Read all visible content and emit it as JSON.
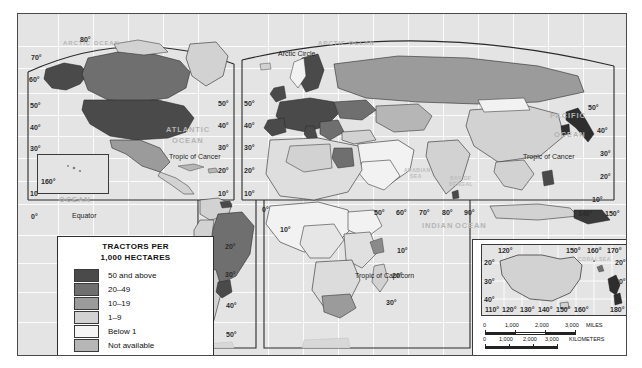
{
  "map": {
    "title": "World Tractors per 1,000 Hectares",
    "projection_note": "MODIFIED GOODE'S HOMOLOSINE EQUAL-AREA PROJECTION"
  },
  "legend": {
    "title_line1": "TRACTORS PER",
    "title_line2": "1,000 HECTARES",
    "items": [
      {
        "label": "50 and above",
        "color": "#4a4a4a"
      },
      {
        "label": "20–49",
        "color": "#6f6f6f"
      },
      {
        "label": "10–19",
        "color": "#9b9b9b"
      },
      {
        "label": "1–9",
        "color": "#d2d2d2"
      },
      {
        "label": "Below 1",
        "color": "#f2f2f2"
      },
      {
        "label": "Not available",
        "color": "#b6b6b6"
      }
    ]
  },
  "ocean_labels": [
    {
      "text": "ARCTIC OCEAN",
      "x": 60,
      "y": 30
    },
    {
      "text": "ARCTIC OCEAN",
      "x": 320,
      "y": 30
    },
    {
      "text": "ATLANTIC",
      "x": 166,
      "y": 115
    },
    {
      "text": "OCEAN",
      "x": 172,
      "y": 126
    },
    {
      "text": "PACIFIC",
      "x": 57,
      "y": 162
    },
    {
      "text": "OCEAN",
      "x": 60,
      "y": 186
    },
    {
      "text": "PACIFIC",
      "x": 551,
      "y": 102
    },
    {
      "text": "OCEAN",
      "x": 555,
      "y": 121
    },
    {
      "text": "INDIAN",
      "x": 422,
      "y": 212
    },
    {
      "text": "OCEAN",
      "x": 455,
      "y": 212
    }
  ],
  "sea_labels": [
    {
      "text": "ARABIAN",
      "x": 404,
      "y": 158
    },
    {
      "text": "SEA",
      "x": 409,
      "y": 164
    },
    {
      "text": "BAY OF",
      "x": 450,
      "y": 166
    },
    {
      "text": "BENGAL",
      "x": 449,
      "y": 172
    },
    {
      "text": "CORAL",
      "x": 559,
      "y": 242
    },
    {
      "text": "SEA",
      "x": 580,
      "y": 242
    }
  ],
  "line_labels": [
    {
      "text": "Arctic Circle",
      "x": 278,
      "y": 40
    },
    {
      "text": "Tropic of Cancer",
      "x": 169,
      "y": 143
    },
    {
      "text": "Tropic of Cancer",
      "x": 540,
      "y": 143
    },
    {
      "text": "Equator",
      "x": 72,
      "y": 202
    },
    {
      "text": "Tropic of Capricorn",
      "x": 372,
      "y": 262
    }
  ],
  "latitude_labels_west": [
    {
      "text": "70°",
      "x": 23,
      "y": 44
    },
    {
      "text": "60°",
      "x": 22,
      "y": 66
    },
    {
      "text": "50°",
      "x": 23,
      "y": 92
    },
    {
      "text": "40°",
      "x": 23,
      "y": 114
    },
    {
      "text": "30°",
      "x": 23,
      "y": 135
    },
    {
      "text": "20°",
      "x": 23,
      "y": 155
    },
    {
      "text": "10°",
      "x": 23,
      "y": 180
    },
    {
      "text": "0°",
      "x": 24,
      "y": 203
    }
  ],
  "latitude_labels_80": {
    "text": "80°",
    "x": 73,
    "y": 26
  },
  "latitude_labels_atlantic": [
    {
      "text": "50°",
      "x": 218,
      "y": 90
    },
    {
      "text": "40°",
      "x": 218,
      "y": 112
    },
    {
      "text": "30°",
      "x": 218,
      "y": 134
    },
    {
      "text": "20°",
      "x": 218,
      "y": 157
    },
    {
      "text": "10°",
      "x": 218,
      "y": 180
    }
  ],
  "latitude_labels_eur": [
    {
      "text": "50°",
      "x": 240,
      "y": 90
    },
    {
      "text": "40°",
      "x": 240,
      "y": 112
    },
    {
      "text": "30°",
      "x": 240,
      "y": 134
    },
    {
      "text": "20°",
      "x": 240,
      "y": 157
    },
    {
      "text": "10°",
      "x": 240,
      "y": 180
    }
  ],
  "latitude_labels_samerica": [
    {
      "text": "10°",
      "x": 200,
      "y": 182
    },
    {
      "text": "20°",
      "x": 225,
      "y": 233
    },
    {
      "text": "30°",
      "x": 225,
      "y": 261
    },
    {
      "text": "40°",
      "x": 226,
      "y": 292
    },
    {
      "text": "50°",
      "x": 226,
      "y": 321
    }
  ],
  "latitude_labels_africa": [
    {
      "text": "10°",
      "x": 330,
      "y": 236
    },
    {
      "text": "20°",
      "x": 325,
      "y": 261
    },
    {
      "text": "30°",
      "x": 317,
      "y": 290
    },
    {
      "text": "10°",
      "x": 397,
      "y": 237
    },
    {
      "text": "20°",
      "x": 392,
      "y": 262
    },
    {
      "text": "30°",
      "x": 386,
      "y": 289
    }
  ],
  "latitude_labels_east": [
    {
      "text": "50°",
      "x": 588,
      "y": 94
    },
    {
      "text": "40°",
      "x": 597,
      "y": 117
    },
    {
      "text": "30°",
      "x": 600,
      "y": 140
    },
    {
      "text": "20°",
      "x": 600,
      "y": 163
    },
    {
      "text": "10°",
      "x": 592,
      "y": 186
    }
  ],
  "longitude_labels_main": [
    {
      "text": "160°",
      "x": 22,
      "y": 166
    },
    {
      "text": "0°",
      "x": 262,
      "y": 196
    },
    {
      "text": "10°",
      "x": 280,
      "y": 216
    },
    {
      "text": "50°",
      "x": 374,
      "y": 199
    },
    {
      "text": "60°",
      "x": 396,
      "y": 199
    },
    {
      "text": "70°",
      "x": 419,
      "y": 199
    },
    {
      "text": "80°",
      "x": 442,
      "y": 199
    },
    {
      "text": "90°",
      "x": 464,
      "y": 199
    },
    {
      "text": "140°",
      "x": 578,
      "y": 200
    },
    {
      "text": "150°",
      "x": 605,
      "y": 200
    }
  ],
  "australia_inset": {
    "lon_top": [
      "120°",
      "150°",
      "160°",
      "170°"
    ],
    "lon_bottom": [
      "110°",
      "120°",
      "130°",
      "140°",
      "150°",
      "160°",
      "180°"
    ],
    "lat_left": [
      "20°",
      "30°",
      "40°"
    ],
    "lat_right": [
      "20°",
      "30°"
    ]
  },
  "scale_miles": {
    "ticks": [
      "0",
      "1,000",
      "2,000",
      "3,000"
    ],
    "unit": "MILES"
  },
  "scale_km": {
    "ticks": [
      "0",
      "1,000",
      "2,000",
      "3,000"
    ],
    "unit": "KILOMETERS"
  }
}
